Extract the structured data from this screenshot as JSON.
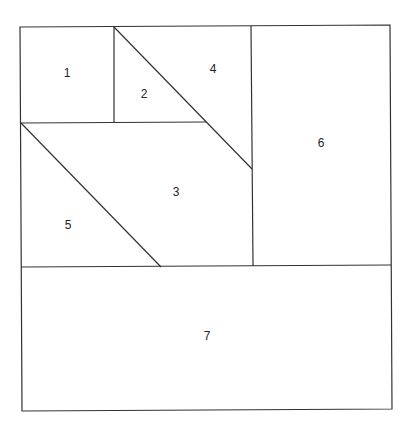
{
  "diagram": {
    "type": "tangram-style partition of a square into numbered regions",
    "stroke_color": "#333333",
    "background": "#ffffff",
    "regions": [
      {
        "id": "1",
        "label": "1",
        "x": 67,
        "y": 74
      },
      {
        "id": "2",
        "label": "2",
        "x": 144,
        "y": 95
      },
      {
        "id": "3",
        "label": "3",
        "x": 176,
        "y": 193
      },
      {
        "id": "4",
        "label": "4",
        "x": 213,
        "y": 70
      },
      {
        "id": "5",
        "label": "5",
        "x": 68,
        "y": 226
      },
      {
        "id": "6",
        "label": "6",
        "x": 321,
        "y": 144
      },
      {
        "id": "7",
        "label": "7",
        "x": 207,
        "y": 337
      }
    ]
  }
}
